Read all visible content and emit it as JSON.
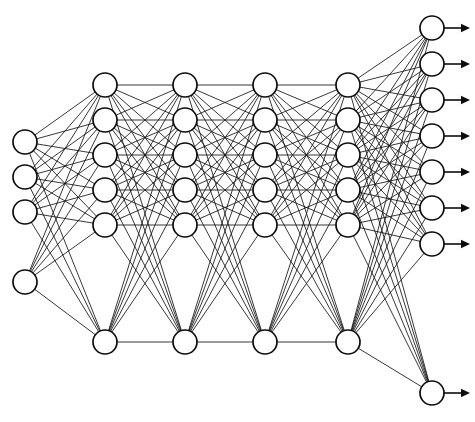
{
  "diagram": {
    "type": "neural-network-graph",
    "canvas": {
      "width": 475,
      "height": 422,
      "background": "#ffffff"
    },
    "style": {
      "node_fill": "#ffffff",
      "node_stroke": "#0d0d0d",
      "node_stroke_width": 1.7,
      "node_radius": 12,
      "edge_color": "#141414",
      "edge_width": 0.85,
      "arrow_color": "#0d0d0d",
      "arrow_length": 26
    },
    "layers": [
      {
        "name": "input-layer",
        "role": "input",
        "index": 0,
        "node_count": 4,
        "x": 25,
        "node_y": [
          142,
          177,
          212,
          282
        ]
      },
      {
        "name": "hidden-layer-1",
        "role": "hidden",
        "index": 1,
        "node_count": 6,
        "x": 105,
        "node_y": [
          85,
          120,
          155,
          190,
          225,
          342
        ]
      },
      {
        "name": "hidden-layer-2",
        "role": "hidden",
        "index": 2,
        "node_count": 6,
        "x": 185,
        "node_y": [
          85,
          120,
          155,
          190,
          225,
          342
        ]
      },
      {
        "name": "hidden-layer-3",
        "role": "hidden",
        "index": 3,
        "node_count": 6,
        "x": 265,
        "node_y": [
          85,
          120,
          155,
          190,
          225,
          342
        ]
      },
      {
        "name": "hidden-layer-4",
        "role": "hidden",
        "index": 4,
        "node_count": 6,
        "x": 348,
        "node_y": [
          85,
          120,
          155,
          190,
          225,
          342
        ]
      },
      {
        "name": "output-layer",
        "role": "output",
        "index": 5,
        "node_count": 8,
        "x": 432,
        "node_y": [
          28,
          64,
          100,
          136,
          172,
          208,
          244,
          393
        ],
        "has_output_arrows": true
      }
    ],
    "connections": [
      {
        "from": 0,
        "to": 1,
        "pattern": "fully-connected"
      },
      {
        "from": 1,
        "to": 2,
        "pattern": "fully-connected"
      },
      {
        "from": 2,
        "to": 3,
        "pattern": "fully-connected"
      },
      {
        "from": 3,
        "to": 4,
        "pattern": "fully-connected"
      },
      {
        "from": 4,
        "to": 5,
        "pattern": "fully-connected"
      }
    ]
  }
}
